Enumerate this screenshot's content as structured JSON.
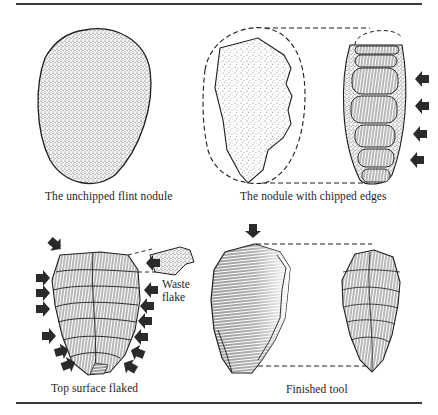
{
  "figure": {
    "panels": [
      {
        "id": "unchipped",
        "caption": "The unchipped flint nodule"
      },
      {
        "id": "chipped",
        "caption": "The nodule with chipped edges"
      },
      {
        "id": "top-flaked",
        "caption": "Top surface flaked"
      },
      {
        "id": "finished",
        "caption": "Finished tool"
      }
    ],
    "annotations": {
      "waste_flake_line1": "Waste",
      "waste_flake_line2": "flake"
    },
    "colors": {
      "ink": "#1e1e1e",
      "stipple": "#555555",
      "arrow": "#2a2a2a",
      "rule": "#3a3a3a"
    }
  }
}
